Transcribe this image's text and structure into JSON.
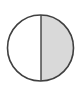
{
  "diagram": {
    "type": "fraction-circle",
    "total_parts": 2,
    "shaded_parts": 1,
    "shaded_fraction": 0.5,
    "shaded_side": "right",
    "colors": {
      "background": "#ffffff",
      "unshaded_fill": "#ffffff",
      "shaded_fill": "#d9d9d9",
      "stroke": "#404040"
    }
  }
}
